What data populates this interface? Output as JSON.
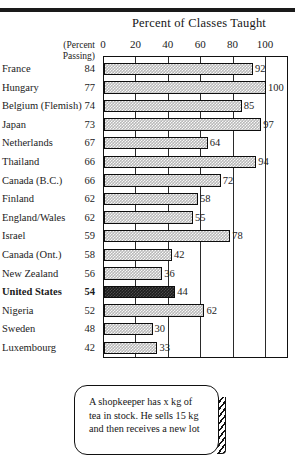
{
  "chart_data": {
    "type": "bar",
    "orientation": "horizontal",
    "title": "Percent of Classes Taught",
    "xlabel": "",
    "ylabel": "",
    "xlim": [
      0,
      114
    ],
    "xticks": [
      0,
      20,
      40,
      60,
      80,
      100
    ],
    "grid": true,
    "legend": "none",
    "secondary_column_header": "(Percent\nPassing)",
    "secondary_column_header_line1": "(Percent",
    "secondary_column_header_line2": "Passing)",
    "categories": [
      "France",
      "Hungary",
      "Belgium (Flemish)",
      "Japan",
      "Netherlands",
      "Thailand",
      "Canada (B.C.)",
      "Finland",
      "England/Wales",
      "Israel",
      "Canada (Ont.)",
      "New Zealand",
      "United States",
      "Nigeria",
      "Sweden",
      "Luxembourg"
    ],
    "series": [
      {
        "name": "Percent of Classes Taught",
        "values": [
          92,
          100,
          85,
          97,
          64,
          94,
          72,
          58,
          55,
          78,
          42,
          36,
          44,
          62,
          30,
          33
        ]
      },
      {
        "name": "Percent Passing",
        "values": [
          84,
          77,
          74,
          73,
          67,
          66,
          66,
          62,
          62,
          59,
          58,
          56,
          54,
          52,
          48,
          42
        ]
      }
    ],
    "highlight_category": "United States"
  },
  "rows": [
    {
      "name": "France",
      "passing": "84",
      "value": 92,
      "label": "92",
      "bold": false
    },
    {
      "name": "Hungary",
      "passing": "77",
      "value": 100,
      "label": "100",
      "bold": false
    },
    {
      "name": "Belgium (Flemish)",
      "passing": "74",
      "value": 85,
      "label": "85",
      "bold": false
    },
    {
      "name": "Japan",
      "passing": "73",
      "value": 97,
      "label": "97",
      "bold": false
    },
    {
      "name": "Netherlands",
      "passing": "67",
      "value": 64,
      "label": "64",
      "bold": false
    },
    {
      "name": "Thailand",
      "passing": "66",
      "value": 94,
      "label": "94",
      "bold": false
    },
    {
      "name": "Canada (B.C.)",
      "passing": "66",
      "value": 72,
      "label": "72",
      "bold": false
    },
    {
      "name": "Finland",
      "passing": "62",
      "value": 58,
      "label": "58",
      "bold": false
    },
    {
      "name": "England/Wales",
      "passing": "62",
      "value": 55,
      "label": "55",
      "bold": false
    },
    {
      "name": "Israel",
      "passing": "59",
      "value": 78,
      "label": "78",
      "bold": false
    },
    {
      "name": "Canada (Ont.)",
      "passing": "58",
      "value": 42,
      "label": "42",
      "bold": false
    },
    {
      "name": "New Zealand",
      "passing": "56",
      "value": 36,
      "label": "36",
      "bold": false
    },
    {
      "name": "United States",
      "passing": "54",
      "value": 44,
      "label": "44",
      "bold": true
    },
    {
      "name": "Nigeria",
      "passing": "52",
      "value": 62,
      "label": "62",
      "bold": false
    },
    {
      "name": "Sweden",
      "passing": "48",
      "value": 30,
      "label": "30",
      "bold": false
    },
    {
      "name": "Luxembourg",
      "passing": "42",
      "value": 33,
      "label": "33",
      "bold": false
    }
  ],
  "caption": {
    "text": "A shopkeeper has x kg of tea in stock. He sells 15 kg and then receives a new lot"
  },
  "colors": {
    "bar_fill": "#b9b9b9",
    "bar_highlight": "#1d1d1d",
    "outline": "#111111",
    "text": "#1b1b1b",
    "background": "#ffffff"
  }
}
